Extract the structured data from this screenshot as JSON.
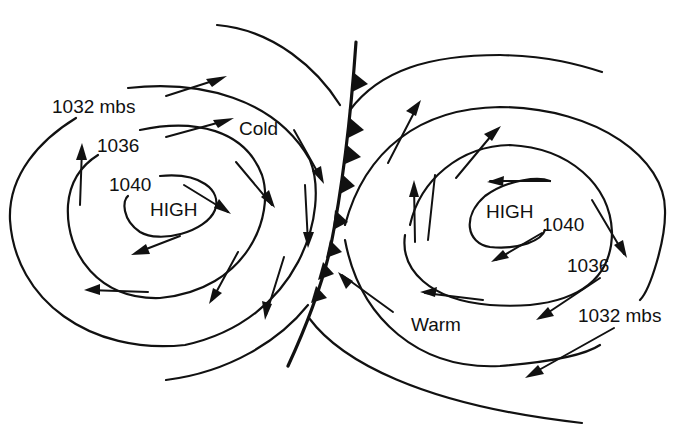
{
  "diagram": {
    "colors": {
      "ink": "#111111",
      "background": "#ffffff"
    },
    "left_system": {
      "center_label": "HIGH",
      "isobars": [
        {
          "label": "1040"
        },
        {
          "label": "1036"
        },
        {
          "label": "1032 mbs"
        }
      ],
      "air_mass_label": "Cold",
      "circulation": "clockwise"
    },
    "right_system": {
      "center_label": "HIGH",
      "isobars": [
        {
          "label": "1040"
        },
        {
          "label": "1036"
        },
        {
          "label": "1032 mbs"
        }
      ],
      "air_mass_label": "Warm",
      "circulation": "clockwise"
    },
    "front": {
      "type": "cold-front",
      "symbol": "filled-triangles"
    }
  }
}
